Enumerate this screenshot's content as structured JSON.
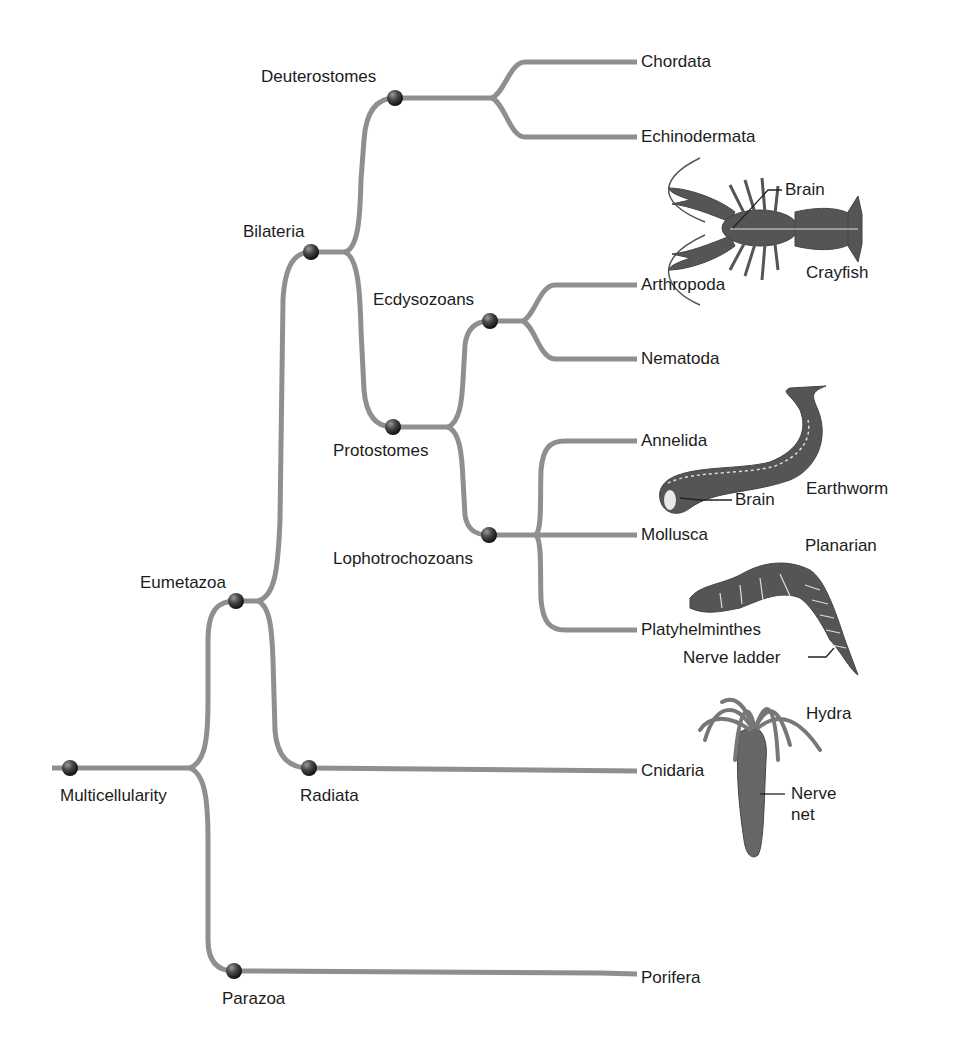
{
  "diagram": {
    "type": "phylogenetic-tree",
    "branch_color": "#8f8f8f",
    "node_color": "#3a3a3a",
    "nodes": [
      {
        "id": "multicellularity",
        "label": "Multicellularity",
        "x": 70,
        "y": 768
      },
      {
        "id": "eumetazoa",
        "label": "Eumetazoa",
        "x": 236,
        "y": 601
      },
      {
        "id": "parazoa",
        "label": "Parazoa",
        "x": 234,
        "y": 971
      },
      {
        "id": "radiata",
        "label": "Radiata",
        "x": 309,
        "y": 768
      },
      {
        "id": "bilateria",
        "label": "Bilateria",
        "x": 311,
        "y": 252
      },
      {
        "id": "deuterostomes",
        "label": "Deuterostomes",
        "x": 395,
        "y": 98
      },
      {
        "id": "protostomes",
        "label": "Protostomes",
        "x": 393,
        "y": 427
      },
      {
        "id": "ecdysozoans",
        "label": "Ecdysozoans",
        "x": 490,
        "y": 321
      },
      {
        "id": "lophotrochozoans",
        "label": "Lophotrochozoans",
        "x": 489,
        "y": 535
      }
    ],
    "tips": [
      {
        "id": "chordata",
        "label": "Chordata",
        "parent": "deuterostomes"
      },
      {
        "id": "echinodermata",
        "label": "Echinodermata",
        "parent": "deuterostomes"
      },
      {
        "id": "arthropoda",
        "label": "Arthropoda",
        "parent": "ecdysozoans"
      },
      {
        "id": "nematoda",
        "label": "Nematoda",
        "parent": "ecdysozoans"
      },
      {
        "id": "annelida",
        "label": "Annelida",
        "parent": "lophotrochozoans"
      },
      {
        "id": "mollusca",
        "label": "Mollusca",
        "parent": "lophotrochozoans"
      },
      {
        "id": "platyhelminthes",
        "label": "Platyhelminthes",
        "parent": "lophotrochozoans"
      },
      {
        "id": "cnidaria",
        "label": "Cnidaria",
        "parent": "radiata"
      },
      {
        "id": "porifera",
        "label": "Porifera",
        "parent": "parazoa"
      }
    ],
    "illustrations": [
      {
        "id": "crayfish",
        "label": "Crayfish",
        "annotations": [
          "Brain"
        ]
      },
      {
        "id": "earthworm",
        "label": "Earthworm",
        "annotations": [
          "Brain"
        ]
      },
      {
        "id": "planarian",
        "label": "Planarian",
        "annotations": [
          "Nerve ladder"
        ]
      },
      {
        "id": "hydra",
        "label": "Hydra",
        "annotations": [
          "Nerve",
          "net"
        ]
      }
    ]
  }
}
